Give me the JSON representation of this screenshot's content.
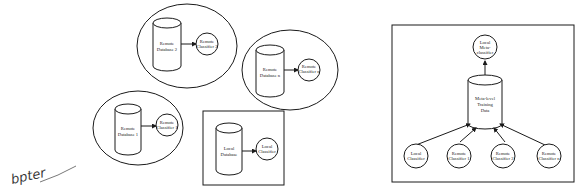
{
  "left_figure": {
    "remote_sites": [
      {
        "database": [
          "Remote",
          "Database 2"
        ],
        "classifier": [
          "Remote",
          "Classifier 2"
        ]
      },
      {
        "database": [
          "Remote",
          "Database n"
        ],
        "classifier": [
          "Remote",
          "Classifier n"
        ]
      },
      {
        "database": [
          "Remote",
          "Database 1"
        ],
        "classifier": [
          "Remote",
          "Classifier 1"
        ]
      }
    ],
    "local_site": {
      "database": [
        "Local",
        "Database"
      ],
      "classifier": [
        "Local",
        "Classifier"
      ]
    }
  },
  "right_figure": {
    "meta_classifier": [
      "Local",
      "Meta-",
      "classifier"
    ],
    "training_data": [
      "Meta-level",
      "Training",
      "Data"
    ],
    "classifiers": [
      [
        "Local",
        "Classifier"
      ],
      [
        "Remote",
        "Classifier 1"
      ],
      [
        "Remote",
        "Classifier 2"
      ],
      [
        "Remote",
        "Classifier n"
      ]
    ]
  },
  "handwriting": "bpter"
}
